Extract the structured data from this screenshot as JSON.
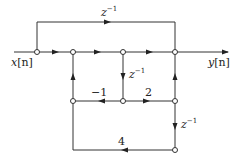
{
  "diagram": {
    "type": "signal-flow-graph",
    "input_label": "x[n]",
    "output_label": "y[n]",
    "branches": [
      {
        "id": "top-delay",
        "from": "n1",
        "to": "n4",
        "gain": "z^-1",
        "label_base": "z",
        "label_exp": "−1"
      },
      {
        "id": "mid-delay",
        "from": "n3",
        "to": "m2",
        "gain": "z^-1",
        "label_base": "z",
        "label_exp": "−1"
      },
      {
        "id": "right-delay",
        "from": "m3",
        "to": "b3",
        "gain": "z^-1",
        "label_base": "z",
        "label_exp": "−1"
      },
      {
        "id": "gain-neg1",
        "from": "m2",
        "to": "m1",
        "gain": "−1"
      },
      {
        "id": "gain-2",
        "from": "m2",
        "to": "m3",
        "gain": "2"
      },
      {
        "id": "gain-4",
        "from": "b3",
        "to": "m1",
        "gain": "4"
      }
    ],
    "labels": {
      "x_base": "x",
      "x_arg": "[n]",
      "y_base": "y",
      "y_arg": "[n]",
      "z": "z",
      "exp": "−1",
      "neg1": "−1",
      "two": "2",
      "four": "4"
    }
  }
}
